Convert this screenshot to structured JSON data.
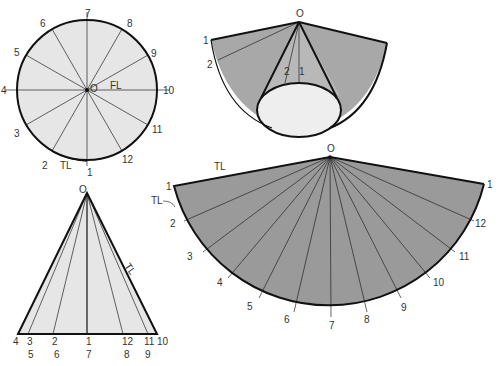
{
  "figure": {
    "colors": {
      "light_fill": "#e8e8e8",
      "dark_fill": "#9a9a9a",
      "line": "#111111",
      "label": "#333333"
    }
  },
  "top_view": {
    "center_label": "O",
    "fl_label": "FL",
    "tl_label": "TL",
    "points": [
      "1",
      "2",
      "3",
      "4",
      "5",
      "6",
      "7",
      "8",
      "9",
      "10",
      "11",
      "12"
    ]
  },
  "front_view": {
    "apex_label": "O",
    "tl_label": "TL",
    "base_labels_top": [
      "4",
      "3",
      "2",
      "1",
      "12",
      "11",
      "10"
    ],
    "base_labels_bottom": [
      "5",
      "6",
      "7",
      "8",
      "9"
    ]
  },
  "cone_pictorial": {
    "apex_label": "O",
    "labels": [
      "1",
      "2",
      "2",
      "1"
    ]
  },
  "development": {
    "apex_label": "O",
    "tl_top_label": "TL",
    "tl_side_label": "TL",
    "element_labels": [
      "1",
      "2",
      "3",
      "4",
      "5",
      "6",
      "7",
      "8",
      "9",
      "10",
      "11",
      "12",
      "1"
    ]
  }
}
